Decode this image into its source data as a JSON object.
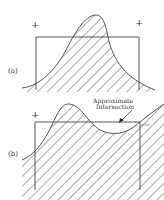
{
  "figure": {
    "panels": [
      {
        "id": "a",
        "label": "(a)",
        "plus_marks": [
          "+",
          "+"
        ]
      },
      {
        "id": "b",
        "label": "(b)",
        "plus_marks": [
          "+"
        ],
        "annotation": {
          "line1": "Approximate",
          "line2": "Intersection"
        }
      }
    ]
  },
  "colors": {
    "stroke": "#555555",
    "hatch": "#444444",
    "background": "#ffffff"
  }
}
